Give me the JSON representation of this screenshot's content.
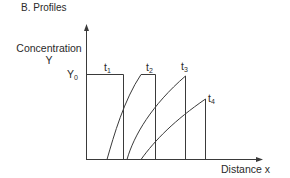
{
  "title": "B. Profiles",
  "axes": {
    "y_label_line1": "Concentration",
    "y_label_line2": "Y",
    "y0_label": "Y",
    "y0_sub": "0",
    "x_label": "Distance x"
  },
  "curves": [
    {
      "label": "t",
      "sub": "1"
    },
    {
      "label": "t",
      "sub": "2"
    },
    {
      "label": "t",
      "sub": "3"
    },
    {
      "label": "t",
      "sub": "4"
    }
  ],
  "colors": {
    "line": "#3a3a3a",
    "text": "#2a2a2a",
    "background": "#ffffff"
  }
}
